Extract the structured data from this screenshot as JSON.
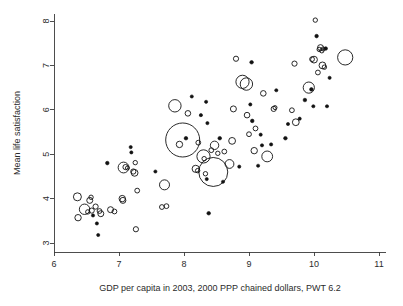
{
  "chart_data": {
    "type": "scatter",
    "title": "",
    "xlabel": "GDP per capita in 2003, 2000 PPP chained dollars, PWT 6.2",
    "ylabel": "Mean life satisfaction",
    "xlim": [
      6,
      11
    ],
    "ylim": [
      3,
      8
    ],
    "xticks": [
      "6",
      "7",
      "8",
      "9",
      "10",
      "11"
    ],
    "yticks": [
      "3",
      "4",
      "5",
      "6",
      "7",
      "8"
    ],
    "grid": false,
    "legend": "none",
    "marker": "open-circle-bubble",
    "size_encoding": "population (bubble area)",
    "series": [
      {
        "name": "countries",
        "points": [
          {
            "x": 6.36,
            "y": 4.04,
            "r": 4.0
          },
          {
            "x": 6.37,
            "y": 3.57,
            "r": 3.2
          },
          {
            "x": 6.47,
            "y": 3.76,
            "r": 5.2
          },
          {
            "x": 6.52,
            "y": 3.7,
            "r": 2.2
          },
          {
            "x": 6.55,
            "y": 3.96,
            "r": 3.0
          },
          {
            "x": 6.57,
            "y": 4.03,
            "r": 2.2
          },
          {
            "x": 6.58,
            "y": 3.73,
            "r": 2.6
          },
          {
            "x": 6.6,
            "y": 3.62,
            "r": 1.6
          },
          {
            "x": 6.64,
            "y": 3.82,
            "r": 2.6
          },
          {
            "x": 6.66,
            "y": 3.44,
            "r": 1.6
          },
          {
            "x": 6.68,
            "y": 3.18,
            "r": 1.6
          },
          {
            "x": 6.7,
            "y": 3.72,
            "r": 2.4
          },
          {
            "x": 6.72,
            "y": 3.66,
            "r": 3.0
          },
          {
            "x": 6.82,
            "y": 4.8,
            "r": 1.8
          },
          {
            "x": 6.87,
            "y": 3.75,
            "r": 3.0
          },
          {
            "x": 6.93,
            "y": 3.71,
            "r": 2.4
          },
          {
            "x": 7.05,
            "y": 4.0,
            "r": 3.2
          },
          {
            "x": 7.06,
            "y": 3.96,
            "r": 3.0
          },
          {
            "x": 7.07,
            "y": 4.7,
            "r": 5.4
          },
          {
            "x": 7.1,
            "y": 4.71,
            "r": 2.6
          },
          {
            "x": 7.13,
            "y": 4.69,
            "r": 2.0
          },
          {
            "x": 7.18,
            "y": 5.16,
            "r": 1.6
          },
          {
            "x": 7.19,
            "y": 5.04,
            "r": 1.6
          },
          {
            "x": 7.22,
            "y": 4.61,
            "r": 2.6
          },
          {
            "x": 7.24,
            "y": 4.58,
            "r": 3.4
          },
          {
            "x": 7.25,
            "y": 4.81,
            "r": 2.2
          },
          {
            "x": 7.26,
            "y": 3.31,
            "r": 2.6
          },
          {
            "x": 7.28,
            "y": 4.18,
            "r": 2.4
          },
          {
            "x": 7.56,
            "y": 4.61,
            "r": 1.6
          },
          {
            "x": 7.66,
            "y": 3.81,
            "r": 2.4
          },
          {
            "x": 7.7,
            "y": 4.31,
            "r": 5.0
          },
          {
            "x": 7.73,
            "y": 3.83,
            "r": 2.4
          },
          {
            "x": 7.86,
            "y": 6.09,
            "r": 6.2
          },
          {
            "x": 7.98,
            "y": 5.32,
            "r": 17.0
          },
          {
            "x": 7.93,
            "y": 5.22,
            "r": 3.2
          },
          {
            "x": 8.03,
            "y": 5.36,
            "r": 1.8
          },
          {
            "x": 8.06,
            "y": 5.92,
            "r": 2.8
          },
          {
            "x": 8.12,
            "y": 6.3,
            "r": 1.6
          },
          {
            "x": 8.18,
            "y": 4.67,
            "r": 3.6
          },
          {
            "x": 8.21,
            "y": 4.63,
            "r": 2.2
          },
          {
            "x": 8.22,
            "y": 5.26,
            "r": 2.4
          },
          {
            "x": 8.26,
            "y": 5.88,
            "r": 1.6
          },
          {
            "x": 8.3,
            "y": 4.95,
            "r": 6.6
          },
          {
            "x": 8.31,
            "y": 4.9,
            "r": 2.2
          },
          {
            "x": 8.33,
            "y": 4.56,
            "r": 2.2
          },
          {
            "x": 8.34,
            "y": 6.18,
            "r": 1.6
          },
          {
            "x": 8.35,
            "y": 4.44,
            "r": 1.6
          },
          {
            "x": 8.36,
            "y": 5.7,
            "r": 1.6
          },
          {
            "x": 8.38,
            "y": 3.67,
            "r": 1.8
          },
          {
            "x": 8.42,
            "y": 5.09,
            "r": 2.4
          },
          {
            "x": 8.45,
            "y": 4.6,
            "r": 14.5
          },
          {
            "x": 8.47,
            "y": 5.2,
            "r": 4.2
          },
          {
            "x": 8.52,
            "y": 5.02,
            "r": 2.2
          },
          {
            "x": 8.55,
            "y": 5.36,
            "r": 1.8
          },
          {
            "x": 8.6,
            "y": 4.38,
            "r": 1.6
          },
          {
            "x": 8.62,
            "y": 5.06,
            "r": 2.4
          },
          {
            "x": 8.7,
            "y": 4.78,
            "r": 4.4
          },
          {
            "x": 8.74,
            "y": 5.3,
            "r": 3.4
          },
          {
            "x": 8.76,
            "y": 6.02,
            "r": 3.0
          },
          {
            "x": 8.8,
            "y": 7.15,
            "r": 2.6
          },
          {
            "x": 8.85,
            "y": 4.72,
            "r": 1.6
          },
          {
            "x": 8.9,
            "y": 6.63,
            "r": 6.6
          },
          {
            "x": 8.96,
            "y": 6.58,
            "r": 6.2
          },
          {
            "x": 8.97,
            "y": 5.88,
            "r": 2.8
          },
          {
            "x": 9.0,
            "y": 5.45,
            "r": 2.4
          },
          {
            "x": 9.02,
            "y": 6.12,
            "r": 1.6
          },
          {
            "x": 9.04,
            "y": 7.07,
            "r": 1.8
          },
          {
            "x": 9.05,
            "y": 5.75,
            "r": 1.8
          },
          {
            "x": 9.08,
            "y": 5.08,
            "r": 3.2
          },
          {
            "x": 9.1,
            "y": 5.58,
            "r": 2.4
          },
          {
            "x": 9.14,
            "y": 4.74,
            "r": 1.6
          },
          {
            "x": 9.18,
            "y": 5.44,
            "r": 1.6
          },
          {
            "x": 9.2,
            "y": 5.2,
            "r": 1.6
          },
          {
            "x": 9.22,
            "y": 6.37,
            "r": 2.8
          },
          {
            "x": 9.28,
            "y": 4.95,
            "r": 5.4
          },
          {
            "x": 9.34,
            "y": 5.22,
            "r": 1.6
          },
          {
            "x": 9.38,
            "y": 6.02,
            "r": 2.6
          },
          {
            "x": 9.4,
            "y": 6.05,
            "r": 2.0
          },
          {
            "x": 9.42,
            "y": 6.44,
            "r": 1.6
          },
          {
            "x": 9.56,
            "y": 5.36,
            "r": 1.8
          },
          {
            "x": 9.6,
            "y": 5.68,
            "r": 1.6
          },
          {
            "x": 9.66,
            "y": 5.99,
            "r": 2.4
          },
          {
            "x": 9.7,
            "y": 7.04,
            "r": 2.6
          },
          {
            "x": 9.72,
            "y": 5.72,
            "r": 3.4
          },
          {
            "x": 9.78,
            "y": 5.8,
            "r": 1.6
          },
          {
            "x": 9.86,
            "y": 6.22,
            "r": 1.8
          },
          {
            "x": 9.92,
            "y": 6.5,
            "r": 5.6
          },
          {
            "x": 9.96,
            "y": 6.46,
            "r": 1.8
          },
          {
            "x": 9.97,
            "y": 7.14,
            "r": 2.4
          },
          {
            "x": 9.99,
            "y": 6.08,
            "r": 1.6
          },
          {
            "x": 10.0,
            "y": 7.13,
            "r": 3.4
          },
          {
            "x": 10.02,
            "y": 8.02,
            "r": 2.2
          },
          {
            "x": 10.04,
            "y": 7.66,
            "r": 1.8
          },
          {
            "x": 10.06,
            "y": 6.84,
            "r": 2.4
          },
          {
            "x": 10.08,
            "y": 7.36,
            "r": 2.2
          },
          {
            "x": 10.1,
            "y": 7.4,
            "r": 3.0
          },
          {
            "x": 10.12,
            "y": 7.33,
            "r": 2.2
          },
          {
            "x": 10.13,
            "y": 7.0,
            "r": 3.4
          },
          {
            "x": 10.14,
            "y": 7.37,
            "r": 2.0
          },
          {
            "x": 10.16,
            "y": 6.96,
            "r": 2.2
          },
          {
            "x": 10.18,
            "y": 7.38,
            "r": 1.8
          },
          {
            "x": 10.2,
            "y": 6.08,
            "r": 1.6
          },
          {
            "x": 10.24,
            "y": 6.72,
            "r": 1.6
          },
          {
            "x": 10.48,
            "y": 7.18,
            "r": 7.6
          }
        ]
      }
    ]
  },
  "axes": {
    "x_axis_name": "gdp-per-capita-axis",
    "y_axis_name": "mean-life-satisfaction-axis"
  }
}
